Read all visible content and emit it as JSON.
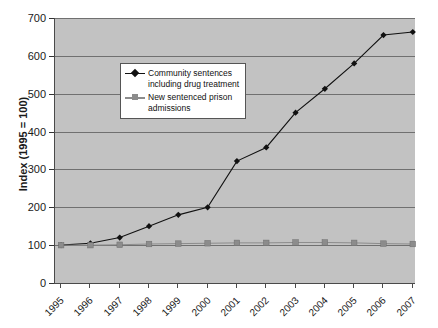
{
  "chart_data": {
    "type": "line",
    "title": "",
    "xlabel": "",
    "ylabel": "Index (1995 = 100)",
    "categories": [
      "1995",
      "1996",
      "1997",
      "1998",
      "1999",
      "2000",
      "2001",
      "2002",
      "2003",
      "2004",
      "2005",
      "2006",
      "2007"
    ],
    "ylim": [
      0,
      700
    ],
    "yticks": [
      0,
      100,
      200,
      300,
      400,
      500,
      600,
      700
    ],
    "ytick_labels": [
      "0",
      "100",
      "200",
      "300",
      "400",
      "500",
      "600",
      "700"
    ],
    "grid": true,
    "legend_position": "upper-left-inside",
    "plot_background": "#c2c2c2",
    "series": [
      {
        "name": "Community sentences including drug treatment",
        "marker": "diamond",
        "color": "#111111",
        "values": [
          100,
          105,
          120,
          150,
          180,
          200,
          322,
          358,
          450,
          513,
          580,
          655,
          663
        ]
      },
      {
        "name": "New sentenced prison admissions",
        "marker": "square",
        "color": "#8c8c8c",
        "values": [
          100,
          100,
          101,
          103,
          104,
          105,
          106,
          106,
          107,
          107,
          106,
          104,
          103
        ]
      }
    ]
  },
  "legend": {
    "entries": [
      {
        "label_line1": "Community sentences",
        "label_line2": "including drug treatment"
      },
      {
        "label_line1": "New sentenced prison",
        "label_line2": "admissions"
      }
    ]
  }
}
